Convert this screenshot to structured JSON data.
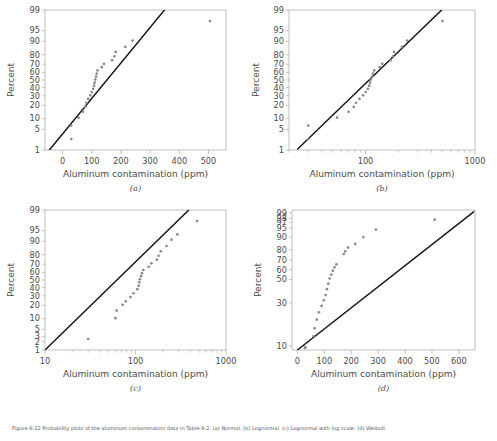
{
  "figure": {
    "caption": "Figure 6-22  Probability plots of the aluminum contamination data in Table 6-2. (a) Normal. (b) Lognormal. (c) Lognormal with log scale. (d) Weibull.",
    "xlabel": "Aluminum contamination (ppm)",
    "ylabel": "Percent"
  },
  "chart_data": [
    {
      "type": "scatter",
      "panel_label": "(a)",
      "title": "",
      "xlabel": "Aluminum contamination (ppm)",
      "ylabel": "Percent",
      "xscale": "linear",
      "yscale": "normal-probability",
      "grid": false,
      "legend": "none",
      "xlim": [
        -60,
        560
      ],
      "xticks": [
        0,
        100,
        200,
        300,
        400,
        500
      ],
      "yticks": [
        1,
        5,
        10,
        20,
        30,
        40,
        50,
        60,
        70,
        80,
        90,
        95,
        99
      ],
      "reference_line": {
        "x": [
          -45,
          365
        ],
        "y": [
          1,
          99.4
        ]
      },
      "points": [
        {
          "x": 30,
          "y": 2.5
        },
        {
          "x": 30,
          "y": 6.5
        },
        {
          "x": 55,
          "y": 10.5
        },
        {
          "x": 70,
          "y": 14.5
        },
        {
          "x": 78,
          "y": 18.5
        },
        {
          "x": 82,
          "y": 22.5
        },
        {
          "x": 88,
          "y": 26.5
        },
        {
          "x": 95,
          "y": 30.5
        },
        {
          "x": 100,
          "y": 34.5
        },
        {
          "x": 105,
          "y": 38.5
        },
        {
          "x": 108,
          "y": 42.5
        },
        {
          "x": 110,
          "y": 46.5
        },
        {
          "x": 112,
          "y": 50.5
        },
        {
          "x": 115,
          "y": 54.5
        },
        {
          "x": 117,
          "y": 58.5
        },
        {
          "x": 120,
          "y": 62.5
        },
        {
          "x": 135,
          "y": 66.5
        },
        {
          "x": 142,
          "y": 70.5
        },
        {
          "x": 170,
          "y": 74.5
        },
        {
          "x": 178,
          "y": 78.5
        },
        {
          "x": 182,
          "y": 82.5
        },
        {
          "x": 215,
          "y": 86.5
        },
        {
          "x": 240,
          "y": 90.5
        },
        {
          "x": 505,
          "y": 97.5
        }
      ]
    },
    {
      "type": "scatter",
      "panel_label": "(b)",
      "title": "",
      "xlabel": "Aluminum contamination (ppm)",
      "ylabel": "Percent",
      "xscale": "log",
      "yscale": "normal-probability",
      "grid": false,
      "legend": "none",
      "xlim": [
        20,
        1000
      ],
      "xticks": [
        100,
        1000
      ],
      "yticks": [
        1,
        5,
        10,
        20,
        30,
        40,
        50,
        60,
        70,
        80,
        90,
        95,
        99
      ],
      "reference_line": {
        "x": [
          24,
          560
        ],
        "y": [
          1.1,
          99.4
        ]
      },
      "points": [
        {
          "x": 30,
          "y": 2.5
        },
        {
          "x": 30,
          "y": 6.5
        },
        {
          "x": 55,
          "y": 10.5
        },
        {
          "x": 70,
          "y": 14.5
        },
        {
          "x": 78,
          "y": 18.5
        },
        {
          "x": 82,
          "y": 22.5
        },
        {
          "x": 88,
          "y": 26.5
        },
        {
          "x": 95,
          "y": 30.5
        },
        {
          "x": 100,
          "y": 34.5
        },
        {
          "x": 105,
          "y": 38.5
        },
        {
          "x": 108,
          "y": 42.5
        },
        {
          "x": 110,
          "y": 46.5
        },
        {
          "x": 112,
          "y": 50.5
        },
        {
          "x": 115,
          "y": 54.5
        },
        {
          "x": 117,
          "y": 58.5
        },
        {
          "x": 120,
          "y": 62.5
        },
        {
          "x": 135,
          "y": 66.5
        },
        {
          "x": 142,
          "y": 70.5
        },
        {
          "x": 170,
          "y": 74.5
        },
        {
          "x": 178,
          "y": 78.5
        },
        {
          "x": 182,
          "y": 82.5
        },
        {
          "x": 215,
          "y": 86.5
        },
        {
          "x": 240,
          "y": 90.5
        },
        {
          "x": 505,
          "y": 97.5
        }
      ]
    },
    {
      "type": "scatter",
      "panel_label": "(c)",
      "title": "",
      "xlabel": "Aluminum contamination (ppm)",
      "ylabel": "Percent",
      "xscale": "log",
      "yscale": "normal-probability",
      "grid": false,
      "legend": "none",
      "xlim": [
        10,
        1000
      ],
      "xticks": [
        10,
        100,
        1000
      ],
      "yticks": [
        1,
        2,
        3,
        5,
        10,
        20,
        30,
        40,
        50,
        60,
        70,
        80,
        90,
        95,
        99
      ],
      "reference_line": {
        "x": [
          10,
          430
        ],
        "y": [
          1,
          99.3
        ]
      },
      "points": [
        {
          "x": 30,
          "y": 2.5
        },
        {
          "x": 60,
          "y": 10.2
        },
        {
          "x": 62,
          "y": 15.5
        },
        {
          "x": 72,
          "y": 20.5
        },
        {
          "x": 78,
          "y": 24.0
        },
        {
          "x": 88,
          "y": 28.5
        },
        {
          "x": 95,
          "y": 33.0
        },
        {
          "x": 105,
          "y": 38.0
        },
        {
          "x": 108,
          "y": 42.5
        },
        {
          "x": 110,
          "y": 47.0
        },
        {
          "x": 112,
          "y": 51.0
        },
        {
          "x": 115,
          "y": 55.0
        },
        {
          "x": 118,
          "y": 59.0
        },
        {
          "x": 122,
          "y": 63.0
        },
        {
          "x": 140,
          "y": 67.0
        },
        {
          "x": 150,
          "y": 71.0
        },
        {
          "x": 172,
          "y": 75.0
        },
        {
          "x": 180,
          "y": 79.0
        },
        {
          "x": 190,
          "y": 83.0
        },
        {
          "x": 220,
          "y": 87.0
        },
        {
          "x": 250,
          "y": 91.0
        },
        {
          "x": 290,
          "y": 93.5
        },
        {
          "x": 480,
          "y": 97.5
        }
      ]
    },
    {
      "type": "scatter",
      "panel_label": "(d)",
      "title": "",
      "xlabel": "Aluminum contamination (ppm)",
      "ylabel": "Percent",
      "xscale": "linear",
      "yscale": "weibull-probability",
      "grid": false,
      "legend": "none",
      "xlim": [
        -20,
        660
      ],
      "xticks": [
        0,
        100,
        200,
        300,
        400,
        500,
        600
      ],
      "yticks": [
        10,
        30,
        50,
        60,
        70,
        80,
        90,
        95,
        97,
        98,
        99
      ],
      "reference_line": {
        "x": [
          0,
          655
        ],
        "y": [
          9.0,
          99.1
        ]
      },
      "points": [
        {
          "x": 28,
          "y": 9.5
        },
        {
          "x": 30,
          "y": 9.7
        },
        {
          "x": 60,
          "y": 13.0
        },
        {
          "x": 64,
          "y": 16.0
        },
        {
          "x": 72,
          "y": 20.0
        },
        {
          "x": 80,
          "y": 24.0
        },
        {
          "x": 90,
          "y": 28.0
        },
        {
          "x": 98,
          "y": 32.0
        },
        {
          "x": 105,
          "y": 36.0
        },
        {
          "x": 110,
          "y": 41.0
        },
        {
          "x": 115,
          "y": 46.0
        },
        {
          "x": 120,
          "y": 51.0
        },
        {
          "x": 126,
          "y": 55.0
        },
        {
          "x": 132,
          "y": 59.0
        },
        {
          "x": 138,
          "y": 62.5
        },
        {
          "x": 145,
          "y": 65.5
        },
        {
          "x": 172,
          "y": 76.0
        },
        {
          "x": 178,
          "y": 78.5
        },
        {
          "x": 188,
          "y": 82.0
        },
        {
          "x": 215,
          "y": 85.0
        },
        {
          "x": 245,
          "y": 90.0
        },
        {
          "x": 292,
          "y": 94.2
        },
        {
          "x": 510,
          "y": 97.7
        }
      ]
    }
  ],
  "panels": {
    "a": {
      "label": "(a)",
      "xticklabels": [
        "0",
        "100",
        "200",
        "300",
        "400",
        "500"
      ],
      "yticklabels": [
        "99",
        "95",
        "90",
        "80",
        "70",
        "60",
        "50",
        "40",
        "30",
        "20",
        "10",
        "5",
        "1"
      ]
    },
    "b": {
      "label": "(b)",
      "xticklabels": [
        "100",
        "1000"
      ],
      "yticklabels": [
        "99",
        "95",
        "90",
        "80",
        "70",
        "60",
        "50",
        "40",
        "30",
        "20",
        "10",
        "5",
        "1"
      ]
    },
    "c": {
      "label": "(c)",
      "xticklabels": [
        "10",
        "100",
        "1000"
      ],
      "yticklabels": [
        "99",
        "95",
        "90",
        "80",
        "70",
        "60",
        "50",
        "40",
        "30",
        "20",
        "10",
        "5",
        "3",
        "2",
        "1"
      ]
    },
    "d": {
      "label": "(d)",
      "xticklabels": [
        "0",
        "100",
        "200",
        "300",
        "400",
        "500",
        "600"
      ],
      "yticklabels": [
        "99",
        "98",
        "97",
        "95",
        "90",
        "80",
        "70",
        "60",
        "50",
        "30",
        "10"
      ]
    }
  }
}
